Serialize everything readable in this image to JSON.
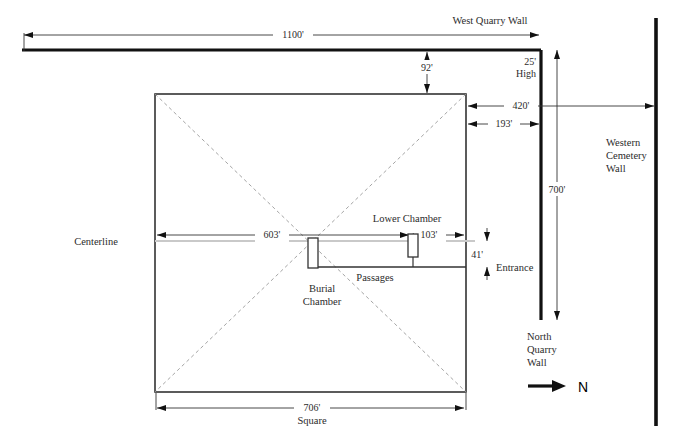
{
  "diagram": {
    "colors": {
      "wall": "#111111",
      "outline": "#333333",
      "dimension": "#333333",
      "diagonal": "#9a9a9a",
      "centerline": "#c9c9c9",
      "text": "#2b2b2b",
      "background": "#ffffff"
    },
    "labels": {
      "west_quarry_wall": "West Quarry Wall",
      "north_quarry_wall": "North Quarry Wall",
      "western_cemetery_wall": "Western Cemetery Wall",
      "centerline": "Centerline",
      "burial_chamber": "Burial Chamber",
      "lower_chamber": "Lower Chamber",
      "passages": "Passages",
      "entrance": "Entrance",
      "square": "Square",
      "north": "N",
      "high": "High"
    },
    "label_lines": {
      "north_quarry_wall": [
        "North",
        "Quarry",
        "Wall"
      ],
      "western_cemetery_wall": [
        "Western",
        "Cemetery",
        "Wall"
      ],
      "burial_chamber": [
        "Burial",
        "Chamber"
      ],
      "wall_height": [
        "25'",
        "High"
      ]
    },
    "dimensions": {
      "top_run": "1100'",
      "wall_height": "25'",
      "gap_to_pyramid": "92'",
      "pyramid_to_cemetery": "420'",
      "pyramid_to_quarry": "193'",
      "quarry_wall_length": "700'",
      "centerline_to_lower_chamber": "603'",
      "lower_chamber_offset": "103'",
      "passage_offset": "41'",
      "pyramid_side": "706'"
    }
  }
}
